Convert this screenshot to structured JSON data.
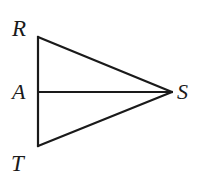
{
  "figure": {
    "type": "geometric-diagram",
    "canvas": {
      "width": 204,
      "height": 187,
      "background": "#ffffff"
    },
    "stroke": {
      "color": "#1a1a1a",
      "width": 2.2
    },
    "points": [
      {
        "id": "R",
        "label": "R",
        "x": 38,
        "y": 37,
        "label_x": 12,
        "label_y": 17
      },
      {
        "id": "A",
        "label": "A",
        "x": 38,
        "y": 92,
        "label_x": 12,
        "label_y": 81
      },
      {
        "id": "T",
        "label": "T",
        "x": 38,
        "y": 146,
        "label_x": 11,
        "label_y": 152
      },
      {
        "id": "S",
        "label": "S",
        "x": 172,
        "y": 92,
        "label_x": 177,
        "label_y": 81
      }
    ],
    "segments": [
      {
        "id": "RT",
        "from": "R",
        "to": "T",
        "x1": 38,
        "y1": 37,
        "x2": 38,
        "y2": 146
      },
      {
        "id": "RS",
        "from": "R",
        "to": "S",
        "x1": 38,
        "y1": 37,
        "x2": 172,
        "y2": 92
      },
      {
        "id": "AS",
        "from": "A",
        "to": "S",
        "x1": 38,
        "y1": 92,
        "x2": 172,
        "y2": 92
      },
      {
        "id": "TS",
        "from": "T",
        "to": "S",
        "x1": 38,
        "y1": 146,
        "x2": 172,
        "y2": 92
      }
    ]
  }
}
